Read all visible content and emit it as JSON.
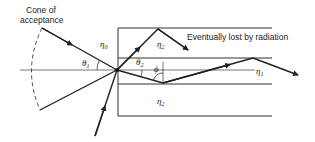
{
  "labels": {
    "cone_line1": "Cone of",
    "cone_line2": "acceptance",
    "radiation": "Eventually lost by radiation"
  },
  "symbols": {
    "eta0": "η",
    "eta0_sub": "0",
    "eta1": "η",
    "eta1_sub": "1",
    "eta2_top": "η",
    "eta2_top_sub": "2",
    "eta2_bottom": "η",
    "eta2_bottom_sub": "2",
    "theta1": "θ",
    "theta1_sub": "1",
    "theta2": "θ",
    "theta2_sub": "2",
    "phi": "ϕ"
  },
  "colors": {
    "line": "#222222",
    "background": "#ffffff"
  }
}
